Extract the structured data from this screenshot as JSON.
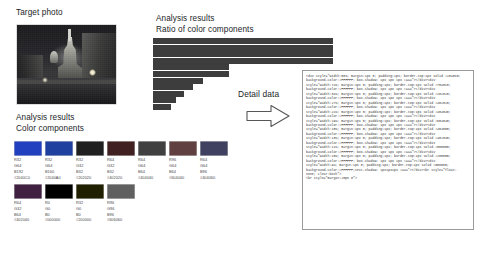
{
  "labels": {
    "target_photo": "Target photo",
    "analysis_results_1": "Analysis results",
    "ratio_of_color_components": "Ratio of color components",
    "analysis_results_2": "Analysis results",
    "color_components": "Color components",
    "detail_data": "Detail data"
  },
  "caption": "",
  "chart_data": {
    "type": "bar",
    "orientation": "horizontal",
    "title": "Ratio of color components",
    "xlabel": "",
    "ylabel": "",
    "grid": false,
    "legend": null,
    "categories": [
      "1",
      "2",
      "3",
      "4",
      "5",
      "6",
      "7",
      "8",
      "9",
      "10",
      "11"
    ],
    "values": [
      100,
      100,
      100,
      100,
      42,
      42,
      28,
      22,
      17,
      13,
      10
    ],
    "xlim": [
      0,
      100
    ],
    "bar_color": "#3d3d3d"
  },
  "swatches": {
    "row1": [
      {
        "hex": "#2040C0",
        "r": "R32",
        "g": "G64",
        "b": "B192",
        "code": "#2040C0"
      },
      {
        "hex": "#2040A0",
        "r": "R32",
        "g": "G64",
        "b": "B160",
        "code": "#2040A0"
      },
      {
        "hex": "#202020",
        "r": "R32",
        "g": "G32",
        "b": "B32",
        "code": "#202020"
      },
      {
        "hex": "#402020",
        "r": "R64",
        "g": "G32",
        "b": "B32",
        "code": "#402020"
      },
      {
        "hex": "#404040",
        "r": "R64",
        "g": "G64",
        "b": "B64",
        "code": "#404040"
      },
      {
        "hex": "#604040",
        "r": "R96",
        "g": "G64",
        "b": "B64",
        "code": "#604040"
      },
      {
        "hex": "#404060",
        "r": "R64",
        "g": "G64",
        "b": "B96",
        "code": "#404060"
      }
    ],
    "row2": [
      {
        "hex": "#402040",
        "r": "R64",
        "g": "G32",
        "b": "B64",
        "code": "#402040"
      },
      {
        "hex": "#000000",
        "r": "R0",
        "g": "G0",
        "b": "B0",
        "code": "#000000"
      },
      {
        "hex": "#202000",
        "r": "R32",
        "g": "G0",
        "b": "B0",
        "code": "#200000"
      },
      {
        "hex": "#606060",
        "r": "R96",
        "g": "G96",
        "b": "B96",
        "code": "#606060"
      }
    ]
  },
  "code_panel": {
    "lines": [
      "<div style=\"width:50%; margin:1px 0; padding:1px; border-top:1px solid #2040C0;",
      "background-color:#FFFFFF;  box-shadow:  1px  1px  1px  #aaa\"></div><div",
      "style=\"width:74%; margin:1px 0; padding:1px; border-top:1px solid #78a0c8;",
      "background-color:#FFFFFF;  box-shadow:  1px  1px  1px  #aaa\"></div><div",
      "style=\"width:34%; margin:1px 0; padding:1px; border-top:1px solid #202020;",
      "background-color:#FFFFFF;  box-shadow:  1px  1px  1px  #aaa\"></div><div",
      "style=\"width:27%; margin:1px 0; padding:1px; border-top:1px solid #402020;",
      "background-color:#FFFFFF;  box-shadow:  1px  1px  1px  #aaa\"></div><div",
      "style=\"width:21%; margin:1px 0; padding:1px; border-top:1px solid #404040;",
      "background-color:#FFFFFF;  box-shadow:  1px  1px  1px  #aaa\"></div><div",
      "style=\"width:19%; margin:1px 0; padding:1px; border-top:1px solid #604040;",
      "background-color:#FFFFFF;  box-shadow:  1px  1px  1px  #aaa\"></div><div",
      "style=\"width:15%; margin:1px 0; padding:1px; border-top:1px solid #404060;",
      "background-color:#FFFFFF;  box-shadow:  1px  1px  1px  #aaa\"></div><div",
      "style=\"width:13%; margin:1px 0; padding:1px; border-top:1px solid #402040;",
      "background-color:#FFFFFF;  box-shadow:  1px  1px  1px  #aaa\"></div><div",
      "style=\"width:11%; margin:1px 0; padding:1px; border-top:1px solid #000000;",
      "background-color:#FFFFFF;  box-shadow:  1px  1px  1px  #aaa\"></div><div",
      "style=\"width:10%; margin:1px 0; padding:1px; border-top:1px solid #200000;",
      "background-color:#FFFFFF;  box-shadow:  1px  1px  1px  #aaa\"></div><div",
      "style=\"width:9%; margin:1px 0; padding:1px; border-top:1px solid #606060;",
      "background-color:#FFFFFF;text-shadow: 1px1px1px #aaa\"></div><br style=\"float:",
      "none;                clear:both\">",
      "<br style=\"margin:20px 0\">"
    ]
  }
}
